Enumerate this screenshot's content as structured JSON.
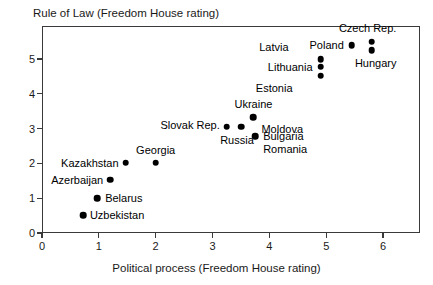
{
  "chart_data": {
    "type": "scatter",
    "title": "Rule of Law (Freedom House rating)",
    "xlabel": "Political process (Freedom House rating)",
    "ylabel": "Rule of Law (Freedom House rating)",
    "xlim": [
      0,
      6.65
    ],
    "ylim": [
      0,
      5.95
    ],
    "xticks": [
      "0",
      "1",
      "2",
      "3",
      "4",
      "5",
      "6"
    ],
    "xtick_values": [
      0,
      1,
      2,
      3,
      4,
      5,
      6
    ],
    "yticks": [
      "0",
      "1",
      "2",
      "3",
      "4",
      "5"
    ],
    "ytick_values": [
      0,
      1,
      2,
      3,
      4,
      5
    ],
    "grid": false,
    "legend": "none",
    "points": [
      {
        "label": "Czech Rep.",
        "x": 5.8,
        "y": 5.5,
        "label_pos": "above",
        "label_dx": -4,
        "label_dy": -14
      },
      {
        "label": "Hungary",
        "x": 5.8,
        "y": 5.25,
        "label_pos": "below",
        "label_dx": 4,
        "label_dy": 13
      },
      {
        "label": "Poland",
        "x": 5.45,
        "y": 5.4,
        "label_pos": "left",
        "label_dx": -8,
        "label_dy": 0
      },
      {
        "label": "Latvia",
        "x": 4.9,
        "y": 5.0,
        "label_pos": "left",
        "label_dx": -32,
        "label_dy": -12
      },
      {
        "label": "Lithuania",
        "x": 4.9,
        "y": 4.78,
        "label_pos": "left",
        "label_dx": -8,
        "label_dy": 0
      },
      {
        "label": "Estonia",
        "x": 4.9,
        "y": 4.52,
        "label_pos": "left",
        "label_dx": -28,
        "label_dy": 12
      },
      {
        "label": "Ukraine",
        "x": 3.72,
        "y": 3.32,
        "label_pos": "above",
        "label_dx": 0,
        "label_dy": -13
      },
      {
        "label": "Slovak Rep.",
        "x": 3.25,
        "y": 3.05,
        "label_pos": "left",
        "label_dx": -7,
        "label_dy": -2
      },
      {
        "label": "Russia",
        "x": 3.5,
        "y": 3.05,
        "label_pos": "below",
        "label_dx": -4,
        "label_dy": 13
      },
      {
        "label": "Moldova",
        "x": 3.72,
        "y": 3.32,
        "label_pos": "right",
        "label_dx": 8,
        "label_dy": 12
      },
      {
        "label": "Bulgaria",
        "x": 3.75,
        "y": 2.78,
        "label_pos": "right",
        "label_dx": 8,
        "label_dy": 0
      },
      {
        "label": "Romania",
        "x": 3.75,
        "y": 2.78,
        "label_pos": "right",
        "label_dx": 8,
        "label_dy": 13
      },
      {
        "label": "Georgia",
        "x": 2.0,
        "y": 2.02,
        "label_pos": "above",
        "label_dx": 0,
        "label_dy": -13
      },
      {
        "label": "Kazakhstan",
        "x": 1.47,
        "y": 2.02,
        "label_pos": "left",
        "label_dx": -7,
        "label_dy": 0
      },
      {
        "label": "Azerbaijan",
        "x": 1.2,
        "y": 1.53,
        "label_pos": "left",
        "label_dx": -7,
        "label_dy": 0
      },
      {
        "label": "Belarus",
        "x": 0.97,
        "y": 1.0,
        "label_pos": "right",
        "label_dx": 8,
        "label_dy": 0
      },
      {
        "label": "Uzbekistan",
        "x": 0.72,
        "y": 0.52,
        "label_pos": "right",
        "label_dx": 7,
        "label_dy": 0
      }
    ]
  }
}
